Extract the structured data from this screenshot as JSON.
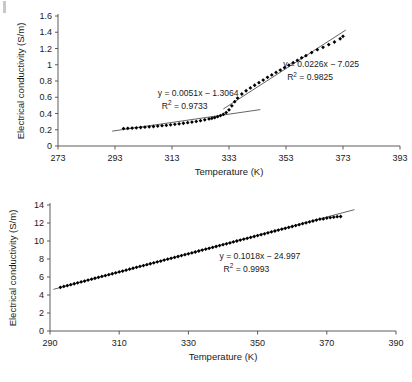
{
  "figure": {
    "panel_count": 2,
    "background": "#ffffff",
    "ink_color": "#1a1a1a",
    "marker_color": "#000000",
    "trendline_color": "#3d3d3d"
  },
  "chart_data": [
    {
      "id": "top-panel",
      "type": "scatter",
      "title": "",
      "xlabel": "Temperature (K)",
      "ylabel": "Electrical conductivity (S/m)",
      "xlim": [
        273,
        393
      ],
      "ylim": [
        0,
        1.6
      ],
      "xticks": [
        273,
        293,
        313,
        333,
        353,
        373,
        393
      ],
      "xtick_labels": [
        "273",
        "293",
        "313",
        "333",
        "353",
        "373",
        "393"
      ],
      "yticks": [
        0,
        0.2,
        0.4,
        0.6,
        0.8,
        1.0,
        1.2,
        1.4,
        1.6
      ],
      "ytick_labels": [
        "0",
        "0.2",
        "0.4",
        "0.6",
        "0.8",
        "1",
        "1.2",
        "1.4",
        "1.6"
      ],
      "grid": false,
      "legend": "none",
      "marker": "filled-diamond",
      "series": [
        {
          "name": "Electrical conductivity",
          "x": [
            296,
            297.5,
            299,
            300.5,
            302,
            303.5,
            305,
            306.5,
            308,
            309.5,
            311,
            312.5,
            314,
            315.5,
            317,
            318.5,
            320,
            321.5,
            323,
            324.5,
            326,
            327,
            328,
            329,
            330,
            331,
            332,
            333,
            334,
            335,
            336,
            337.5,
            339,
            340.5,
            342,
            343.5,
            345,
            346.5,
            348,
            349.5,
            351,
            352.5,
            354,
            355.5,
            357,
            358.5,
            360,
            362,
            364,
            366,
            368,
            370,
            372,
            373
          ],
          "y": [
            0.215,
            0.218,
            0.221,
            0.224,
            0.228,
            0.232,
            0.236,
            0.24,
            0.245,
            0.25,
            0.255,
            0.261,
            0.267,
            0.273,
            0.28,
            0.287,
            0.295,
            0.303,
            0.312,
            0.322,
            0.333,
            0.341,
            0.35,
            0.361,
            0.374,
            0.39,
            0.412,
            0.445,
            0.495,
            0.545,
            0.59,
            0.64,
            0.68,
            0.715,
            0.748,
            0.78,
            0.812,
            0.845,
            0.875,
            0.905,
            0.935,
            0.965,
            0.995,
            1.025,
            1.055,
            1.085,
            1.112,
            1.15,
            1.185,
            1.215,
            1.248,
            1.28,
            1.32,
            1.35
          ]
        }
      ],
      "trendlines": [
        {
          "name": "low-temperature-fit",
          "equation": "y = 0.0051x − 1.3064",
          "r2_label": "R",
          "r2_exponent": "2",
          "r2_value": " = 0.9733",
          "slope": 0.0051,
          "intercept": -1.3064,
          "r2": 0.9733,
          "x_start": 292,
          "x_end": 344,
          "annotation_x": 308,
          "annotation_y": 0.62
        },
        {
          "name": "high-temperature-fit",
          "equation": "y = 0.0226x − 7.025",
          "r2_label": "R",
          "r2_exponent": "2",
          "r2_value": " = 0.9825",
          "slope": 0.0226,
          "intercept": -7.025,
          "r2": 0.9825,
          "x_start": 331,
          "x_end": 374,
          "annotation_x": 352,
          "annotation_y": 0.97
        }
      ]
    },
    {
      "id": "bottom-panel",
      "type": "scatter",
      "title": "",
      "xlabel": "Temperature (K)",
      "ylabel": "Electrical conductivity (S/m)",
      "xlim": [
        290,
        390
      ],
      "ylim": [
        0,
        14
      ],
      "xticks": [
        290,
        310,
        330,
        350,
        370,
        390
      ],
      "xtick_labels": [
        "290",
        "310",
        "330",
        "350",
        "370",
        "390"
      ],
      "yticks": [
        0,
        2,
        4,
        6,
        8,
        10,
        12,
        14
      ],
      "ytick_labels": [
        "0",
        "2",
        "4",
        "6",
        "8",
        "10",
        "12",
        "14"
      ],
      "grid": false,
      "legend": "none",
      "marker": "filled-diamond",
      "series": [
        {
          "name": "Electrical conductivity",
          "x": [
            293,
            294,
            295,
            296,
            297,
            298,
            299,
            300,
            301,
            302,
            303,
            304,
            305,
            306,
            307,
            308,
            309,
            310,
            311,
            312,
            313,
            314,
            315,
            316,
            317,
            318,
            319,
            320,
            321,
            322,
            323,
            324,
            325,
            326,
            327,
            328,
            329,
            330,
            331,
            332,
            333,
            334,
            335,
            336,
            337,
            338,
            339,
            340,
            341,
            342,
            343,
            344,
            345,
            346,
            347,
            348,
            349,
            350,
            351,
            352,
            353,
            354,
            355,
            356,
            357,
            358,
            359,
            360,
            361,
            362,
            363,
            364,
            365,
            366,
            367,
            368,
            369,
            370,
            371,
            372,
            373,
            374
          ],
          "y": [
            4.85,
            4.95,
            5.05,
            5.15,
            5.25,
            5.35,
            5.45,
            5.55,
            5.66,
            5.76,
            5.86,
            5.96,
            6.06,
            6.16,
            6.26,
            6.36,
            6.46,
            6.56,
            6.66,
            6.76,
            6.87,
            6.97,
            7.07,
            7.17,
            7.27,
            7.37,
            7.47,
            7.57,
            7.67,
            7.77,
            7.88,
            7.98,
            8.08,
            8.18,
            8.28,
            8.38,
            8.48,
            8.58,
            8.68,
            8.78,
            8.89,
            8.99,
            9.09,
            9.19,
            9.29,
            9.39,
            9.49,
            9.59,
            9.69,
            9.79,
            9.9,
            10.0,
            10.1,
            10.2,
            10.3,
            10.4,
            10.5,
            10.6,
            10.7,
            10.8,
            10.91,
            11.01,
            11.11,
            11.21,
            11.31,
            11.41,
            11.51,
            11.61,
            11.71,
            11.81,
            11.92,
            12.02,
            12.12,
            12.22,
            12.32,
            12.42,
            12.45,
            12.55,
            12.6,
            12.65,
            12.7,
            12.72
          ]
        }
      ],
      "trendlines": [
        {
          "name": "linear-fit",
          "equation": "y = 0.1018x − 24.997",
          "r2_label": "R",
          "r2_exponent": "2",
          "r2_value": " = 0.9993",
          "slope": 0.1018,
          "intercept": -24.997,
          "r2": 0.9993,
          "x_start": 291,
          "x_end": 378,
          "annotation_x": 339,
          "annotation_y": 8.05
        }
      ]
    }
  ]
}
